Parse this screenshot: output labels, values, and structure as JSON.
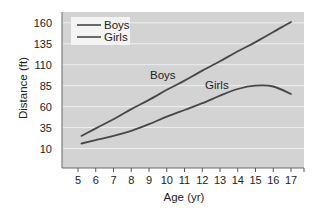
{
  "chart_data": {
    "type": "line",
    "title": "",
    "xlabel": "Age (yr)",
    "ylabel": "Distance (ft)",
    "x": [
      5,
      6,
      7,
      8,
      9,
      10,
      11,
      12,
      13,
      14,
      15,
      16,
      17
    ],
    "x_ticks": [
      "5",
      "6",
      "7",
      "8",
      "9",
      "10",
      "11",
      "12",
      "13",
      "14",
      "15",
      "16",
      "17"
    ],
    "y_ticks": [
      10,
      35,
      60,
      85,
      110,
      135,
      160
    ],
    "ylim": [
      0,
      170
    ],
    "xlim": [
      4.2,
      17.7
    ],
    "grid": true,
    "legend_position": "upper left",
    "series": [
      {
        "name": "Boys",
        "x": [
          5.2,
          6,
          7,
          8,
          9,
          10,
          11,
          12,
          13,
          14,
          15,
          16,
          17
        ],
        "values": [
          25,
          34,
          45,
          57,
          68,
          80,
          91,
          103,
          114,
          126,
          137,
          149,
          161
        ]
      },
      {
        "name": "Girls",
        "x": [
          5.2,
          6,
          7,
          8,
          9,
          10,
          11,
          12,
          13,
          14,
          15,
          16,
          17
        ],
        "values": [
          16,
          20,
          25,
          31,
          39,
          48,
          56,
          64,
          73,
          81,
          85,
          84,
          75
        ]
      }
    ],
    "annotations": [
      {
        "text": "Boys",
        "x": 10.3,
        "y": 97
      },
      {
        "text": "Girls",
        "x": 12.4,
        "y": 84
      }
    ]
  },
  "legend": {
    "items": [
      {
        "label": "Boys"
      },
      {
        "label": "Girls"
      }
    ]
  },
  "labels": {
    "boys_inline": "Boys",
    "girls_inline": "Girls",
    "xlabel": "Age (yr)",
    "ylabel": "Distance (ft)"
  },
  "colors": {
    "plot_bg": "#d3d3d3",
    "grid": "#eeeeee",
    "line": "#474747",
    "axis": "#555555"
  }
}
